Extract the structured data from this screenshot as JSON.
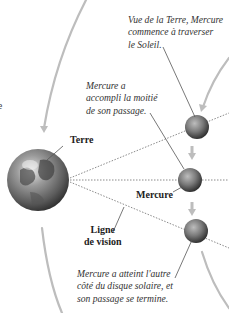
{
  "diagram": {
    "title_hint": "Transit de Mercure vu de la Terre",
    "bodies": {
      "earth": {
        "label": "Terre"
      },
      "mercury": {
        "label": "Mercure"
      }
    },
    "line_of_sight_label": [
      "Ligne",
      "de vision"
    ],
    "annotations": {
      "start": [
        "Vue de la Terre, Mercure",
        "commence à traverser",
        "le Soleil."
      ],
      "middle": [
        "Mercure a",
        "accompli la moitié",
        "de son passage."
      ],
      "end": [
        "Mercure a atteint l'autre",
        "côté du disque solaire, et",
        "son passage se termine."
      ]
    },
    "left_edge_fragment": "e",
    "colors": {
      "arc": "#bdbdbd",
      "dotted_line": "#8a8a8a",
      "leader_line": "#555555",
      "text": "#333333"
    }
  }
}
